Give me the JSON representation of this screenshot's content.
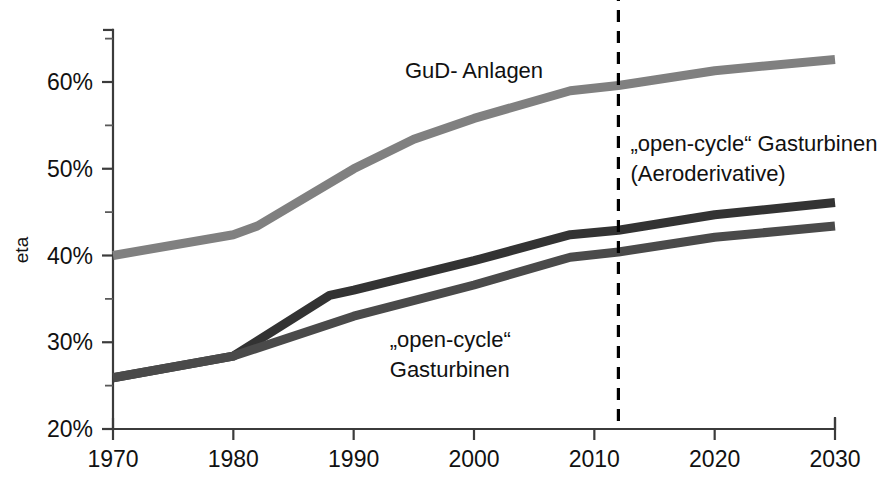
{
  "chart_data": {
    "type": "line",
    "title": "",
    "xlabel": "",
    "ylabel": "eta",
    "xlim": [
      1970,
      2030
    ],
    "ylim": [
      20,
      66
    ],
    "grid": false,
    "legend": "inline-annotations",
    "x_ticks": [
      "1970",
      "1980",
      "1990",
      "2000",
      "2010",
      "2020",
      "2030"
    ],
    "x_tick_values": [
      1970,
      1980,
      1990,
      2000,
      2010,
      2020,
      2030
    ],
    "y_ticks": [
      "20%",
      "30%",
      "40%",
      "50%",
      "60%"
    ],
    "y_tick_values": [
      20,
      30,
      40,
      50,
      60
    ],
    "y_minor_values": [
      25,
      35,
      45,
      55,
      65
    ],
    "series": [
      {
        "name": "GuD- Anlagen",
        "color": "#808080",
        "width": 9,
        "points": [
          [
            1970,
            40.0
          ],
          [
            1980,
            42.4
          ],
          [
            1982,
            43.4
          ],
          [
            1990,
            50.0
          ],
          [
            1995,
            53.4
          ],
          [
            2000,
            55.8
          ],
          [
            2008,
            59.0
          ],
          [
            2012,
            59.6
          ],
          [
            2020,
            61.3
          ],
          [
            2030,
            62.6
          ]
        ]
      },
      {
        "name": "„open-cycle“ Gasturbinen (Aeroderivative)",
        "color": "#333333",
        "width": 9,
        "points": [
          [
            1970,
            25.9
          ],
          [
            1980,
            28.4
          ],
          [
            1988,
            35.4
          ],
          [
            1990,
            36.0
          ],
          [
            2000,
            39.4
          ],
          [
            2008,
            42.4
          ],
          [
            2012,
            42.9
          ],
          [
            2020,
            44.7
          ],
          [
            2030,
            46.1
          ]
        ]
      },
      {
        "name": "„open-cycle“ Gasturbinen",
        "color": "#4a4a4a",
        "width": 9,
        "points": [
          [
            1970,
            25.9
          ],
          [
            1980,
            28.4
          ],
          [
            1990,
            33.0
          ],
          [
            2000,
            36.6
          ],
          [
            2008,
            39.8
          ],
          [
            2012,
            40.4
          ],
          [
            2020,
            42.1
          ],
          [
            2030,
            43.4
          ]
        ]
      }
    ],
    "annotations": [
      {
        "id": "gud",
        "lines": [
          "GuD- Anlagen"
        ],
        "x": 2000,
        "y": 60.5
      },
      {
        "id": "aeroderivative",
        "lines": [
          "„open-cycle“ Gasturbinen",
          "(Aeroderivative)"
        ],
        "x": 2013,
        "y": 52.0
      },
      {
        "id": "open-cycle",
        "lines": [
          "„open-cycle“",
          "Gasturbinen"
        ],
        "x": 1993,
        "y": 29.5
      }
    ],
    "divider": {
      "label": "",
      "x": 2012,
      "style": "dashed",
      "color": "#000000"
    }
  }
}
